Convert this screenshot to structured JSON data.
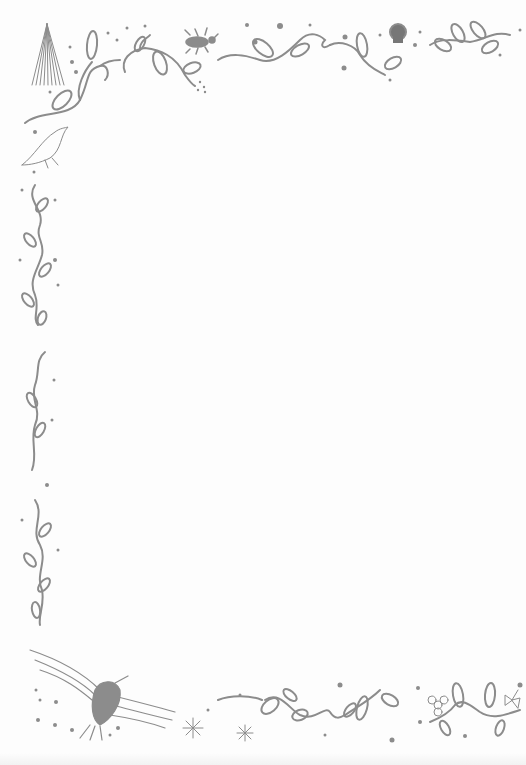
{
  "page": {
    "type": "decorative stationery",
    "background": "#fdfdfd",
    "ink_color": "#8c8c8c"
  },
  "decorations": {
    "top_left": [
      "pine-tree",
      "leafy-vine",
      "songbird"
    ],
    "top_center": [
      "beetle",
      "leafy-vine"
    ],
    "top_right": [
      "skull",
      "leafy-vine"
    ],
    "left_edge": [
      "leafy-vine",
      "curly-vine",
      "leafy-vine"
    ],
    "bottom_left": [
      "eagle",
      "snowflake",
      "snowflake"
    ],
    "bottom_right": [
      "leafy-vine",
      "flower",
      "butterfly"
    ]
  },
  "writing_area": {
    "text": ""
  }
}
